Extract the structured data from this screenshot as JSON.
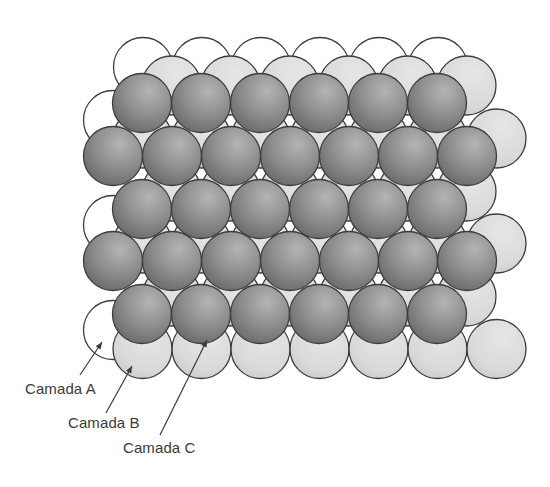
{
  "figure": {
    "colors": {
      "background": "#ffffff",
      "outline": "#3c3c3c",
      "layer_a_fill": "#ffffff",
      "layer_b_fill": "#dcdcdc",
      "layer_b_shade": "#c8c8c8",
      "layer_c_highlight": "#b4b4b4",
      "layer_c_mid": "#8e8e8e",
      "layer_c_edge": "#6a6a6a",
      "label_text": "#3a3a3a",
      "arrow": "#3a3a3a"
    },
    "sphere_radius": 29.5,
    "layers": {
      "A": {
        "name": "Camada A",
        "spheres": [
          [
            143,
            67
          ],
          [
            202,
            67
          ],
          [
            261,
            67
          ],
          [
            320,
            67
          ],
          [
            379,
            67
          ],
          [
            438,
            67
          ],
          [
            113,
            120
          ],
          [
            113,
            225
          ],
          [
            113,
            330
          ]
        ]
      },
      "B": {
        "name": "Camada B",
        "rows": [
          {
            "y": 85.5,
            "x_start": 171.5,
            "count": 6
          },
          {
            "y": 138.5,
            "x_start": 142.5,
            "count": 7
          },
          {
            "y": 191.5,
            "x_start": 171.5,
            "count": 6
          },
          {
            "y": 243.5,
            "x_start": 142.5,
            "count": 7
          },
          {
            "y": 296.5,
            "x_start": 171.5,
            "count": 6
          },
          {
            "y": 349,
            "x_start": 142.5,
            "count": 7
          }
        ],
        "spacing": 59
      },
      "C": {
        "name": "Camada C",
        "rows": [
          {
            "y": 103,
            "x_start": 142,
            "count": 6
          },
          {
            "y": 156,
            "x_start": 113,
            "count": 7
          },
          {
            "y": 209,
            "x_start": 142,
            "count": 6
          },
          {
            "y": 261,
            "x_start": 113,
            "count": 7
          },
          {
            "y": 314,
            "x_start": 142,
            "count": 6
          }
        ],
        "spacing": 59
      }
    },
    "labels": [
      {
        "id": "a",
        "text": "Camada A",
        "x": 25,
        "y": 381,
        "arrow": {
          "x1": 80,
          "y1": 375,
          "x2": 102,
          "y2": 342
        }
      },
      {
        "id": "b",
        "text": "Camada B",
        "x": 68,
        "y": 415,
        "arrow": {
          "x1": 106,
          "y1": 413,
          "x2": 132,
          "y2": 366
        }
      },
      {
        "id": "c",
        "text": "Camada C",
        "x": 123,
        "y": 440,
        "arrow": {
          "x1": 160,
          "y1": 435,
          "x2": 207,
          "y2": 340
        }
      }
    ]
  }
}
